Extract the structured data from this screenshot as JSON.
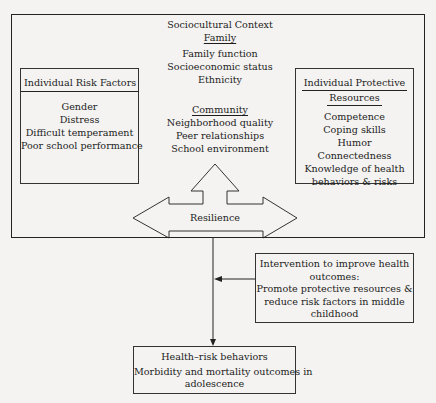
{
  "sociocultural": {
    "title": "Sociocultural Context",
    "family": {
      "heading": "Family",
      "items": [
        "Family function",
        "Socioeconomic status",
        "Ethnicity"
      ]
    },
    "community": {
      "heading": "Community",
      "items": [
        "Neighborhood quality",
        "Peer relationships",
        "School environment"
      ]
    }
  },
  "risk_factors": {
    "heading": "Individual Risk Factors",
    "items": [
      "Gender",
      "Distress",
      "Difficult temperament",
      "Poor school performance"
    ]
  },
  "protective": {
    "heading_line1": "Individual Protective",
    "heading_line2": "Resources",
    "items": [
      "Competence",
      "Coping skills",
      "Humor",
      "Connectedness",
      "Knowledge of health",
      "behaviors & risks"
    ]
  },
  "resilience": {
    "label": "Resilience"
  },
  "intervention": {
    "line1": "Intervention to improve health",
    "line2": "outcomes:",
    "line3": "Promote protective resources &",
    "line4": "reduce risk factors in middle",
    "line5": "childhood"
  },
  "outcome": {
    "line1": "Health–risk behaviors",
    "line2": "Morbidity and mortality outcomes in",
    "line3": "adolescence"
  }
}
